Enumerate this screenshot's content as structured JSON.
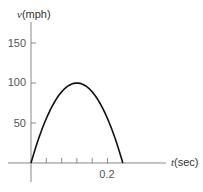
{
  "chart_data": {
    "type": "line",
    "title": "",
    "xlabel": "t(sec)",
    "xlabel_var": "t",
    "xlabel_unit": "(sec)",
    "ylabel": "v(mph)",
    "ylabel_var": "v",
    "ylabel_unit": "(mph)",
    "xlim": [
      0,
      0.24
    ],
    "ylim": [
      0,
      175
    ],
    "x_ticks": [
      0.04,
      0.08,
      0.12,
      0.16,
      0.2
    ],
    "x_tick_labels": [
      "",
      "",
      "",
      "",
      "0.2"
    ],
    "y_ticks": [
      50,
      100,
      150
    ],
    "y_tick_labels": [
      "50",
      "100",
      "150"
    ],
    "grid": false,
    "legend": null,
    "series": [
      {
        "name": "v(t)",
        "description": "Parabolic velocity curve: starts at 0, peaks at 100 mph at t=0.12 s, returns to 0 at t=0.24 s",
        "x": [
          0,
          0.02,
          0.04,
          0.06,
          0.08,
          0.1,
          0.12,
          0.14,
          0.16,
          0.18,
          0.2,
          0.22,
          0.24
        ],
        "values": [
          0,
          30.6,
          55.6,
          75,
          88.9,
          97.2,
          100,
          97.2,
          88.9,
          75,
          55.6,
          30.6,
          0
        ]
      }
    ],
    "colors": {
      "curve": "#111111",
      "axes": "#888888",
      "text": "#444444"
    }
  },
  "labels": {
    "y_var": "v",
    "y_unit": "(mph)",
    "x_var": "t",
    "x_unit": "(sec)",
    "y150": "150",
    "y100": "100",
    "y50": "50",
    "x02": "0.2"
  }
}
